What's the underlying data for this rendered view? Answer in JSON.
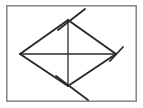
{
  "figure": {
    "title": "Rhombus with diagonals and congruence tick marks",
    "caption": "",
    "canvas": {
      "width": 143,
      "height": 108
    },
    "colors": {
      "background": "#ffffff",
      "frame_stroke": "#8a8a8a",
      "frame_fill": "#ffffff",
      "line_stroke": "#2b2b2b",
      "tick_stroke": "#2b2b2b"
    },
    "frame": {
      "name": "figure-border",
      "x": 6,
      "y": 5,
      "width": 131,
      "height": 97,
      "stroke_width": 1.6
    },
    "vertices": [
      {
        "id": "top",
        "label": "",
        "x": 68,
        "y": 20,
        "has_tick": true,
        "tick_type": "single-slash"
      },
      {
        "id": "right",
        "label": "",
        "x": 116,
        "y": 54,
        "has_tick": true,
        "tick_type": "single-slash"
      },
      {
        "id": "bottom",
        "label": "",
        "x": 68,
        "y": 86,
        "has_tick": true,
        "tick_type": "single-slash"
      },
      {
        "id": "left",
        "label": "",
        "x": 20,
        "y": 54,
        "has_tick": false,
        "tick_type": "none"
      }
    ],
    "edges": [
      {
        "id": "edge-top-left",
        "from": "left",
        "to": "top",
        "stroke_width": 2.0
      },
      {
        "id": "edge-top-right",
        "from": "top",
        "to": "right",
        "stroke_width": 2.0
      },
      {
        "id": "edge-bottom-right",
        "from": "right",
        "to": "bottom",
        "stroke_width": 2.0
      },
      {
        "id": "edge-bottom-left",
        "from": "bottom",
        "to": "left",
        "stroke_width": 2.0
      }
    ],
    "diagonals": [
      {
        "id": "diagonal-horizontal",
        "from": "left",
        "to": "right",
        "x1": 20,
        "y1": 54,
        "x2": 116,
        "y2": 54,
        "stroke_width": 1.3
      },
      {
        "id": "diagonal-vertical",
        "from": "top",
        "to": "bottom",
        "x1": 68,
        "y1": 20,
        "x2": 68,
        "y2": 86,
        "stroke_width": 1.3
      }
    ],
    "tick_marks": [
      {
        "id": "tick-top",
        "at_vertex": "top",
        "x1": 58,
        "y1": 30,
        "x2": 85,
        "y2": 9,
        "stroke_width": 1.8
      },
      {
        "id": "tick-right",
        "at_vertex": "right",
        "x1": 110,
        "y1": 61,
        "x2": 123,
        "y2": 47,
        "stroke_width": 1.8
      },
      {
        "id": "tick-bottom",
        "at_vertex": "bottom",
        "x1": 56,
        "y1": 76,
        "x2": 88,
        "y2": 100,
        "stroke_width": 1.8
      }
    ]
  }
}
